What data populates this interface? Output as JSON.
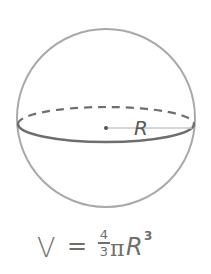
{
  "diagram": {
    "shape": "sphere",
    "radius_label": "R",
    "colors": {
      "outline": "#a9a9a9",
      "equator_front": "#6e6e6e",
      "equator_back_dashed": "#6e6e6e",
      "radius_line": "#c8c8c8",
      "center_dot": "#555555",
      "text": "#6f6f6f"
    }
  },
  "formula": {
    "lhs": "V",
    "equals": "=",
    "numerator": "4",
    "denominator": "3",
    "pi": "π",
    "variable": "R",
    "exponent": "3"
  }
}
